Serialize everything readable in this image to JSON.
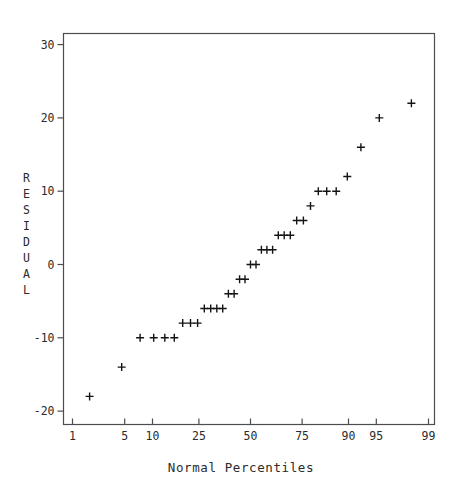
{
  "colors": {
    "background": "#ffffff",
    "axis": "#4d4d4d",
    "text": "#2b2b2b",
    "marker": "#141414"
  },
  "chart_data": {
    "type": "scatter",
    "title": "",
    "marker_glyph": "+",
    "xlabel": "Normal Percentiles",
    "ylabel": "RESIDUAL",
    "legend": "none",
    "grid": "off",
    "x_axis": {
      "scale": "normal-probability",
      "tick_labels": [
        "1",
        "5",
        "10",
        "25",
        "50",
        "75",
        "90",
        "95",
        "99"
      ],
      "tick_percentiles": [
        1,
        5,
        10,
        25,
        50,
        75,
        90,
        95,
        99
      ]
    },
    "y_axis": {
      "scale": "linear",
      "tick_labels": [
        "30",
        "20",
        "10",
        "0",
        "-10",
        "-20"
      ],
      "tick_values": [
        30,
        20,
        10,
        0,
        -10,
        -20
      ],
      "range": [
        -21.8,
        31.6
      ]
    },
    "points": {
      "count": 35,
      "percentiles": [
        1.77,
        4.61,
        7.45,
        10.28,
        13.12,
        15.96,
        18.79,
        21.63,
        24.47,
        27.3,
        30.14,
        32.98,
        35.82,
        38.65,
        41.49,
        44.33,
        47.16,
        50.0,
        52.84,
        55.67,
        58.51,
        61.35,
        64.18,
        67.02,
        69.86,
        72.7,
        75.53,
        78.37,
        81.21,
        84.04,
        86.88,
        89.72,
        92.55,
        95.39,
        98.23
      ],
      "residuals": [
        -18,
        -14,
        -10,
        -10,
        -10,
        -10,
        -8,
        -8,
        -8,
        -6,
        -6,
        -6,
        -6,
        -4,
        -4,
        -2,
        -2,
        0,
        0,
        2,
        2,
        2,
        4,
        4,
        4,
        6,
        6,
        8,
        10,
        10,
        10,
        12,
        16,
        20,
        22
      ]
    }
  }
}
